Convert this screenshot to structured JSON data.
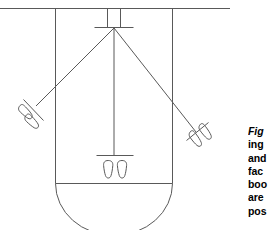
{
  "figure": {
    "stroke_color": "#595959",
    "background_color": "#ffffff",
    "elements": {
      "top_rule_label": "top horizontal rule",
      "room_outline_label": "room outline with rounded bottom",
      "apex_label": "apex convergence point",
      "center_line_label": "center vertical sight line",
      "left_sight_line_label": "left diagonal sight line",
      "right_sight_line_label": "right diagonal sight line",
      "top_footprints_label": "top footprint pair",
      "left_footprints_label": "left footprint pair",
      "right_footprints_label": "right footprint pair",
      "center_footprints_label": "center footprint pair"
    }
  },
  "caption": {
    "lead": "Fig",
    "lines": [
      "ing",
      "and",
      "fac",
      "boo",
      "are",
      "pos"
    ]
  }
}
